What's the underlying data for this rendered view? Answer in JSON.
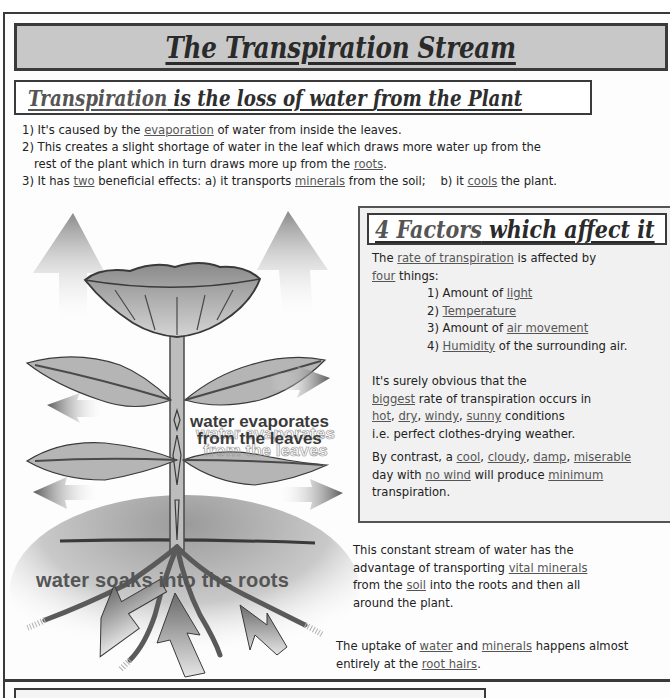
{
  "header": {
    "title": "The Transpiration Stream"
  },
  "definition": {
    "part1": "Transpiration",
    "part2": " is the loss of water ",
    "part3": "from the Plant"
  },
  "intro_points": [
    {
      "a": "1) It's caused by the ",
      "u1": "evaporation",
      "b": " of water from inside the leaves."
    },
    {
      "a": "2) This creates a slight shortage of water in the leaf which draws more water up from the",
      "b": "rest of the plant which in turn draws more up from the ",
      "u1": "roots",
      "c": "."
    },
    {
      "a": "3) It has ",
      "u1": "two",
      "b": " beneficial effects: a) it transports ",
      "u2": "minerals",
      "c": " from the soil;    b) it ",
      "u3": "cools",
      "d": " the plant."
    }
  ],
  "factors": {
    "title_part1": "4 Factors",
    "title_part2": " which affect it",
    "intro_a": "The ",
    "intro_u1": "rate of transpiration",
    "intro_b": " is affected by",
    "intro_u2": "four",
    "intro_c": " things:",
    "items": [
      {
        "prefix": "1) Amount of ",
        "term": "light",
        "suffix": ""
      },
      {
        "prefix": "2) ",
        "term": "Temperature",
        "suffix": ""
      },
      {
        "prefix": "3) Amount of ",
        "term": "air movement",
        "suffix": ""
      },
      {
        "prefix": "4) ",
        "term": "Humidity",
        "suffix": " of the surrounding air."
      }
    ],
    "para1": {
      "l1": "It's surely obvious that the",
      "u_biggest": "biggest",
      "l2": " rate of transpiration occurs in",
      "u_hot": "hot",
      "u_dry": "dry",
      "u_windy": "windy",
      "u_sunny": "sunny",
      "l3": " conditions",
      "l4": "i.e. perfect clothes-drying weather."
    },
    "para2": {
      "a": "By contrast, a ",
      "u_cool": "cool",
      "u_cloudy": "cloudy",
      "u_damp": "damp",
      "u_miserable": "miserable",
      "b": "day with ",
      "u_nowind": "no wind",
      "c": " will produce ",
      "u_minimum": "minimum",
      "d": "transpiration."
    },
    "sep": ", "
  },
  "stream": {
    "l1": "This constant stream of water has the",
    "l2a": "advantage of transporting ",
    "u_vital": "vital minerals",
    "l3a": "from the ",
    "u_soil": "soil",
    "l3b": " into the roots and then all",
    "l4": "around the plant."
  },
  "uptake": {
    "a": "The uptake of ",
    "u_water": "water",
    "b": " and ",
    "u_minerals": "minerals",
    "c": " happens almost",
    "d": "entirely at the ",
    "u_roothairs": "root hairs",
    "e": "."
  },
  "diagram": {
    "label_evaporates_1": "water evaporates",
    "label_evaporates_2": "from the leaves",
    "label_roots": "water soaks into the roots"
  },
  "colors": {
    "banner_bg": "#c8c8c8",
    "factors_bg": "#f1f1f1",
    "border": "#3a3a3a",
    "text": "#222222",
    "underline_text": "#555555"
  }
}
